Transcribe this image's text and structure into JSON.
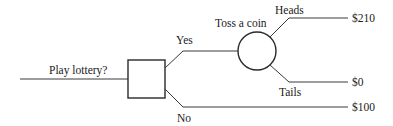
{
  "diagram": {
    "type": "decision-tree",
    "decision_node": {
      "label": "Play lottery?",
      "shape": "square"
    },
    "chance_node": {
      "label": "Toss a coin",
      "shape": "circle"
    },
    "branches": {
      "yes": "Yes",
      "no": "No",
      "heads": "Heads",
      "tails": "Tails"
    },
    "outcomes": {
      "heads": "$210",
      "tails": "$0",
      "no": "$100"
    }
  }
}
